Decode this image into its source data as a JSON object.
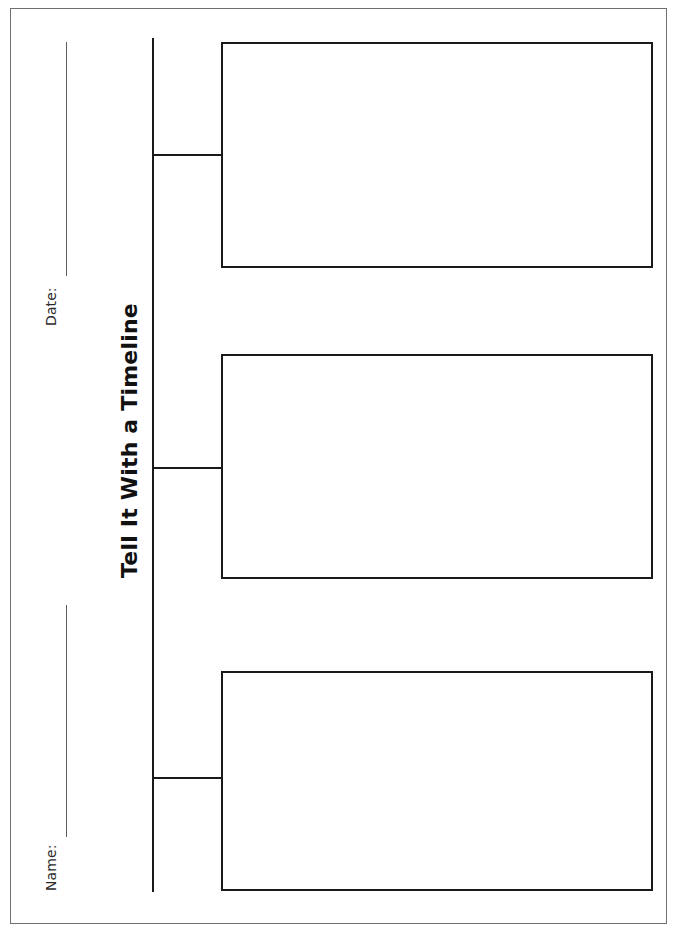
{
  "document": {
    "title": "Tell It With a Timeline",
    "paper_background": "#ffffff",
    "border_color": "#6f6f6f",
    "ink_color": "#1a1a1a"
  },
  "fields": {
    "name": {
      "label": "Name:",
      "value": ""
    },
    "date": {
      "label": "Date:",
      "value": ""
    }
  },
  "timeline": {
    "orientation": "vertical",
    "event_count": 3,
    "events": [
      {
        "index": "1",
        "text": ""
      },
      {
        "index": "2",
        "text": ""
      },
      {
        "index": "3",
        "text": ""
      }
    ]
  }
}
